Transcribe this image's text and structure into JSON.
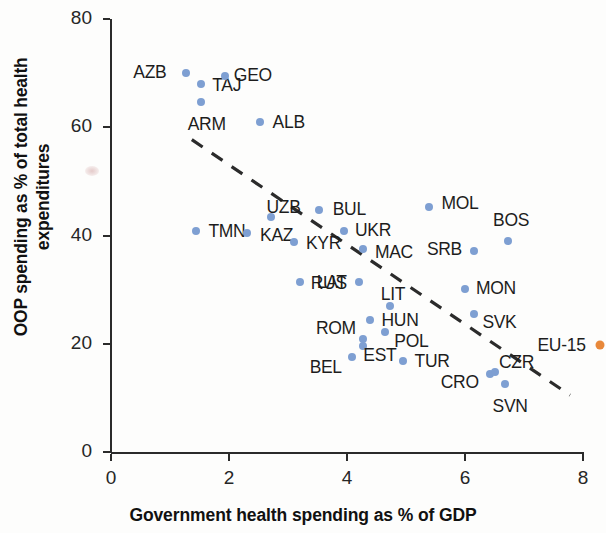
{
  "chart_data": {
    "type": "scatter",
    "title": "",
    "xlabel": "Government health spending as % of GDP",
    "ylabel": "OOP spending as % of total health expenditures",
    "xlim": [
      0,
      8
    ],
    "ylim": [
      0,
      80
    ],
    "xticks": [
      "0",
      "2",
      "4",
      "6",
      "8"
    ],
    "yticks": [
      "0",
      "20",
      "40",
      "60",
      "80"
    ],
    "grid": false,
    "legend": "none",
    "series": [
      {
        "name": "Countries",
        "color": "#7e9fd2",
        "points": [
          {
            "label": "AZB",
            "x": 1.27,
            "y": 70.0,
            "label_dx": -36,
            "label_dy": -1
          },
          {
            "label": "TAJ",
            "x": 1.52,
            "y": 68.0,
            "label_dx": 26,
            "label_dy": 1
          },
          {
            "label": "GEO",
            "x": 1.93,
            "y": 69.5,
            "label_dx": 28,
            "label_dy": -1
          },
          {
            "label": "ARM",
            "x": 1.52,
            "y": 64.6,
            "label_dx": 6,
            "label_dy": 22
          },
          {
            "label": "ALB",
            "x": 2.52,
            "y": 61.0,
            "label_dx": 29,
            "label_dy": 0
          },
          {
            "label": "TMN",
            "x": 1.44,
            "y": 40.8,
            "label_dx": 31,
            "label_dy": 0
          },
          {
            "label": "KAZ",
            "x": 2.3,
            "y": 40.5,
            "label_dx": 30,
            "label_dy": 2
          },
          {
            "label": "UZB",
            "x": 2.72,
            "y": 43.5,
            "label_dx": 12,
            "label_dy": -10
          },
          {
            "label": "BUL",
            "x": 3.53,
            "y": 44.8,
            "label_dx": 30,
            "label_dy": -1
          },
          {
            "label": "MOL",
            "x": 5.39,
            "y": 45.3,
            "label_dx": 31,
            "label_dy": -4
          },
          {
            "label": "UKR",
            "x": 3.95,
            "y": 40.8,
            "label_dx": 29,
            "label_dy": -1
          },
          {
            "label": "KYR",
            "x": 3.11,
            "y": 38.8,
            "label_dx": 29,
            "label_dy": 1
          },
          {
            "label": "MAC",
            "x": 4.27,
            "y": 37.5,
            "label_dx": 31,
            "label_dy": 3
          },
          {
            "label": "BOS",
            "x": 6.73,
            "y": 39.0,
            "label_dx": 3,
            "label_dy": -21
          },
          {
            "label": "SRB",
            "x": 6.16,
            "y": 37.2,
            "label_dx": -30,
            "label_dy": -2
          },
          {
            "label": "RUS",
            "x": 3.2,
            "y": 31.5,
            "label_dx": 29,
            "label_dy": 1
          },
          {
            "label": "LAT",
            "x": 4.2,
            "y": 31.5,
            "label_dx": -27,
            "label_dy": 0
          },
          {
            "label": "MON",
            "x": 6.0,
            "y": 30.2,
            "label_dx": 31,
            "label_dy": -1
          },
          {
            "label": "LIT",
            "x": 4.73,
            "y": 27.0,
            "label_dx": 3,
            "label_dy": -12
          },
          {
            "label": "SVK",
            "x": 6.16,
            "y": 25.5,
            "label_dx": 25,
            "label_dy": 8
          },
          {
            "label": "HUN",
            "x": 4.39,
            "y": 24.4,
            "label_dx": 30,
            "label_dy": 0
          },
          {
            "label": "POL",
            "x": 4.65,
            "y": 22.2,
            "label_dx": 26,
            "label_dy": 9
          },
          {
            "label": "ROM",
            "x": 4.27,
            "y": 20.8,
            "label_dx": -27,
            "label_dy": -11
          },
          {
            "label": "EST",
            "x": 4.27,
            "y": 19.5,
            "label_dx": 17,
            "label_dy": 9
          },
          {
            "label": "BEL",
            "x": 4.08,
            "y": 17.5,
            "label_dx": -26,
            "label_dy": 10
          },
          {
            "label": "TUR",
            "x": 4.95,
            "y": 16.8,
            "label_dx": 29,
            "label_dy": 0
          },
          {
            "label": "CRO",
            "x": 6.42,
            "y": 14.5,
            "label_dx": -30,
            "label_dy": 8
          },
          {
            "label": "CZR",
            "x": 6.5,
            "y": 14.8,
            "label_dx": 22,
            "label_dy": -10
          },
          {
            "label": "SVN",
            "x": 6.68,
            "y": 12.5,
            "label_dx": 5,
            "label_dy": 22
          }
        ]
      },
      {
        "name": "EU-15",
        "color": "#e8883a",
        "points": [
          {
            "label": "EU-15",
            "x": 8.28,
            "y": 19.8,
            "label_dx": -38,
            "label_dy": 0
          }
        ]
      }
    ],
    "trendline": {
      "style": "dashed",
      "color": "#2b2b2b",
      "x_start": 1.37,
      "y_start": 57.7,
      "x_end": 7.78,
      "y_end": 10.5
    },
    "annotations": []
  }
}
